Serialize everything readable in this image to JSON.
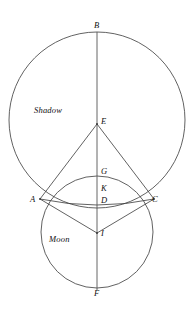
{
  "figure": {
    "background_color": "#ffffff",
    "stroke_color": "#3a3a3a",
    "label_color": "#111111",
    "width": 195,
    "height": 313
  },
  "region_labels": [
    {
      "id": "shadow",
      "text": "Shadow",
      "x": 34,
      "y": 106
    },
    {
      "id": "moon",
      "text": "Moon",
      "x": 49,
      "y": 235
    }
  ],
  "point_labels": [
    {
      "id": "B",
      "text": "B",
      "x": 94,
      "y": 21
    },
    {
      "id": "E",
      "text": "E",
      "x": 101,
      "y": 117
    },
    {
      "id": "G",
      "text": "G",
      "x": 101,
      "y": 167
    },
    {
      "id": "K",
      "text": "K",
      "x": 101,
      "y": 184
    },
    {
      "id": "D",
      "text": "D",
      "x": 101,
      "y": 196
    },
    {
      "id": "A",
      "text": "A",
      "x": 30,
      "y": 195
    },
    {
      "id": "C",
      "text": "C",
      "x": 152,
      "y": 195
    },
    {
      "id": "I",
      "text": "I",
      "x": 101,
      "y": 229
    },
    {
      "id": "F",
      "text": "F",
      "x": 94,
      "y": 289
    }
  ],
  "points": {
    "B": {
      "x": 97,
      "y": 32
    },
    "E": {
      "x": 97,
      "y": 124
    },
    "G": {
      "x": 97,
      "y": 176
    },
    "K": {
      "x": 97,
      "y": 190
    },
    "D": {
      "x": 97,
      "y": 203
    },
    "A": {
      "x": 40,
      "y": 199
    },
    "C": {
      "x": 154,
      "y": 199
    },
    "I": {
      "x": 97,
      "y": 233
    },
    "F": {
      "x": 97,
      "y": 288
    }
  },
  "circles": [
    {
      "id": "shadow-circle",
      "name": "Shadow circle",
      "cx": 97,
      "cy": 120,
      "r": 88
    },
    {
      "id": "moon-circle",
      "name": "Moon circle",
      "cx": 97,
      "cy": 232,
      "r": 56
    }
  ],
  "arcs": [
    {
      "id": "chord-arc-adc",
      "name": "Arc through A, D, C",
      "from": "A",
      "through": "D",
      "to": "C"
    }
  ],
  "segments": [
    {
      "id": "axis-bf",
      "name": "Vertical axis B to F",
      "from": "B",
      "to": "F"
    },
    {
      "id": "ea",
      "name": "Segment E to A",
      "from": "E",
      "to": "A"
    },
    {
      "id": "ec",
      "name": "Segment E to C",
      "from": "E",
      "to": "C"
    },
    {
      "id": "ia",
      "name": "Segment I to A",
      "from": "I",
      "to": "A"
    },
    {
      "id": "ic",
      "name": "Segment I to C",
      "from": "I",
      "to": "C"
    }
  ]
}
